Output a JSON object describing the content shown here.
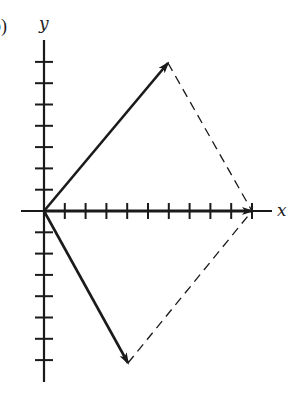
{
  "figure": {
    "panel_label": "b)",
    "x_axis_label": "x",
    "y_axis_label": "y",
    "colors": {
      "ink": "#1a1a1a",
      "background": "#ffffff"
    },
    "grid_units": {
      "x_ticks_positive": 10,
      "y_ticks_positive": 7,
      "y_ticks_negative": 7
    },
    "vectors": [
      {
        "name": "upper-vector",
        "from": [
          0,
          0
        ],
        "to": [
          6,
          7
        ],
        "style": "solid-arrow"
      },
      {
        "name": "lower-vector",
        "from": [
          0,
          0
        ],
        "to": [
          4,
          -7
        ],
        "style": "solid-arrow"
      },
      {
        "name": "resultant-vector",
        "from": [
          0,
          0
        ],
        "to": [
          10,
          0
        ],
        "style": "solid-arrow"
      }
    ],
    "dashed_lines": [
      {
        "name": "parallelogram-side-upper",
        "from": [
          6,
          7
        ],
        "to": [
          10,
          0
        ]
      },
      {
        "name": "parallelogram-side-lower",
        "from": [
          4,
          -7
        ],
        "to": [
          10,
          0
        ]
      }
    ]
  }
}
